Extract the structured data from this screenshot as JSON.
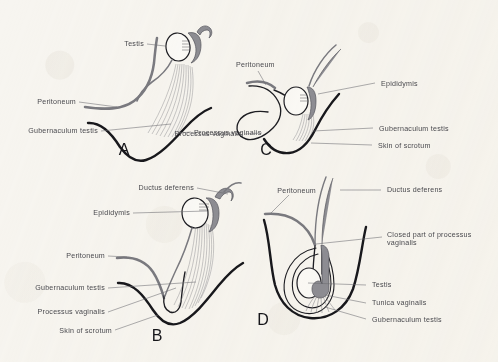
{
  "figure": {
    "background_color": "#f7f5f0",
    "ink_color": "#1d1d22",
    "label_color": "#4a4a4f",
    "gray_structure_color": "#8e8e94",
    "peritoneum_color": "#7a7a80"
  },
  "panels": [
    {
      "id": "A",
      "letter": "A",
      "labels": [
        {
          "key": "testis",
          "text": "Testis"
        },
        {
          "key": "peritoneum",
          "text": "Peritoneum"
        },
        {
          "key": "gubernaculum",
          "text": "Gubernaculum testis"
        },
        {
          "key": "processus",
          "text": "Processus vaginalis"
        }
      ]
    },
    {
      "id": "C",
      "letter": "C",
      "labels": [
        {
          "key": "peritoneum",
          "text": "Peritoneum"
        },
        {
          "key": "epididymis",
          "text": "Epididymis"
        },
        {
          "key": "gubernaculum",
          "text": "Gubernaculum testis"
        },
        {
          "key": "skin",
          "text": "Skin of scrotum"
        },
        {
          "key": "processus",
          "text": "Processus vaginalis"
        }
      ]
    },
    {
      "id": "B",
      "letter": "B",
      "labels": [
        {
          "key": "ductus",
          "text": "Ductus deferens"
        },
        {
          "key": "epididymis",
          "text": "Epididymis"
        },
        {
          "key": "peritoneum",
          "text": "Peritoneum"
        },
        {
          "key": "gubernaculum",
          "text": "Gubernaculum testis"
        },
        {
          "key": "processus",
          "text": "Processus vaginalis"
        },
        {
          "key": "skin",
          "text": "Skin of scrotum"
        }
      ]
    },
    {
      "id": "D",
      "letter": "D",
      "labels": [
        {
          "key": "peritoneum",
          "text": "Peritoneum"
        },
        {
          "key": "ductus",
          "text": "Ductus deferens"
        },
        {
          "key": "closed_line1",
          "text": "Closed part of processus"
        },
        {
          "key": "closed_line2",
          "text": "vaginalis"
        },
        {
          "key": "testis",
          "text": "Testis"
        },
        {
          "key": "tunica",
          "text": "Tunica vaginalis"
        },
        {
          "key": "gubernaculum",
          "text": "Gubernaculum testis"
        }
      ]
    }
  ]
}
